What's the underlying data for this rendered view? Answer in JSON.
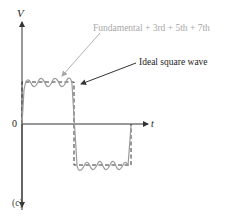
{
  "figure": {
    "panel_label": "(c)",
    "y_axis_label": "V",
    "x_axis_label": "t",
    "origin_label": "0",
    "annotations": {
      "approximation_label": "Fundamental + 3rd + 5th + 7th",
      "ideal_label": "Ideal square wave"
    },
    "colors": {
      "axis": "#333333",
      "ideal_wave": "#333333",
      "approximation_wave": "#9a9a9a",
      "approximation_text": "#a8a8a8",
      "text": "#222222"
    },
    "series": [
      {
        "name": "Ideal square wave",
        "style": "dashed",
        "levels": [
          "high",
          "low"
        ]
      },
      {
        "name": "Fundamental + 3rd + 5th + 7th",
        "style": "solid",
        "harmonics": [
          1,
          3,
          5,
          7
        ]
      }
    ]
  }
}
